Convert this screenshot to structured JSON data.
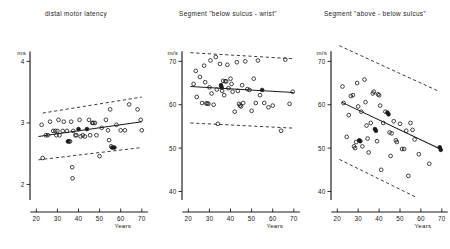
{
  "figure": {
    "panel_count": 3,
    "marker_open": "open-circle",
    "marker_filled": "filled-circle"
  },
  "chart_data": [
    {
      "type": "scatter",
      "title": "distal  motor  latency",
      "xlabel": "Years",
      "ylabel": "ms",
      "xlim": [
        17,
        72
      ],
      "ylim": [
        1.78,
        4.25
      ],
      "xticks": [
        20,
        30,
        40,
        50,
        60,
        70
      ],
      "yticks": [
        2,
        3,
        4
      ],
      "grid": false,
      "legend": "none",
      "regression": {
        "x": [
          21,
          70
        ],
        "y": [
          2.78,
          3.02
        ]
      },
      "confidence_upper": {
        "x": [
          23,
          70
        ],
        "y": [
          3.16,
          3.42
        ]
      },
      "confidence_lower": {
        "x": [
          21,
          70
        ],
        "y": [
          2.4,
          2.6
        ]
      },
      "points": [
        {
          "x": 22.5,
          "y": 2.97,
          "filled": false
        },
        {
          "x": 23.0,
          "y": 2.43,
          "filled": false
        },
        {
          "x": 24.5,
          "y": 2.8,
          "filled": false
        },
        {
          "x": 25.5,
          "y": 2.8,
          "filled": false
        },
        {
          "x": 26.5,
          "y": 3.02,
          "filled": false
        },
        {
          "x": 28.0,
          "y": 2.87,
          "filled": false
        },
        {
          "x": 29.0,
          "y": 2.87,
          "filled": false
        },
        {
          "x": 29.5,
          "y": 2.8,
          "filled": false
        },
        {
          "x": 30.0,
          "y": 2.87,
          "filled": false
        },
        {
          "x": 30.5,
          "y": 3.05,
          "filled": false
        },
        {
          "x": 31.0,
          "y": 2.8,
          "filled": false
        },
        {
          "x": 32.5,
          "y": 2.87,
          "filled": false
        },
        {
          "x": 33.0,
          "y": 3.02,
          "filled": false
        },
        {
          "x": 34.5,
          "y": 2.87,
          "filled": false
        },
        {
          "x": 35.0,
          "y": 2.7,
          "filled": true
        },
        {
          "x": 35.5,
          "y": 2.7,
          "filled": false
        },
        {
          "x": 36.0,
          "y": 2.7,
          "filled": false
        },
        {
          "x": 36.5,
          "y": 3.02,
          "filled": false
        },
        {
          "x": 37.0,
          "y": 2.28,
          "filled": false
        },
        {
          "x": 37.2,
          "y": 2.1,
          "filled": false
        },
        {
          "x": 37.5,
          "y": 2.87,
          "filled": false
        },
        {
          "x": 38.5,
          "y": 2.8,
          "filled": false
        },
        {
          "x": 39.0,
          "y": 2.8,
          "filled": false
        },
        {
          "x": 40.0,
          "y": 2.9,
          "filled": true
        },
        {
          "x": 40.5,
          "y": 3.05,
          "filled": false
        },
        {
          "x": 41.0,
          "y": 2.78,
          "filled": false
        },
        {
          "x": 42.0,
          "y": 2.8,
          "filled": false
        },
        {
          "x": 43.0,
          "y": 2.78,
          "filled": false
        },
        {
          "x": 44.0,
          "y": 2.9,
          "filled": true
        },
        {
          "x": 45.0,
          "y": 3.05,
          "filled": false
        },
        {
          "x": 45.5,
          "y": 2.8,
          "filled": false
        },
        {
          "x": 46.5,
          "y": 3.0,
          "filled": false
        },
        {
          "x": 47.0,
          "y": 3.0,
          "filled": false
        },
        {
          "x": 47.8,
          "y": 3.0,
          "filled": false
        },
        {
          "x": 48.5,
          "y": 2.8,
          "filled": false
        },
        {
          "x": 50.0,
          "y": 2.46,
          "filled": false
        },
        {
          "x": 51.0,
          "y": 2.92,
          "filled": false
        },
        {
          "x": 53.0,
          "y": 3.05,
          "filled": false
        },
        {
          "x": 54.0,
          "y": 2.88,
          "filled": false
        },
        {
          "x": 54.5,
          "y": 2.72,
          "filled": false
        },
        {
          "x": 55.0,
          "y": 3.22,
          "filled": false
        },
        {
          "x": 55.5,
          "y": 2.62,
          "filled": false
        },
        {
          "x": 56.0,
          "y": 2.6,
          "filled": true
        },
        {
          "x": 57.0,
          "y": 2.6,
          "filled": true
        },
        {
          "x": 58.0,
          "y": 2.97,
          "filled": false
        },
        {
          "x": 60.0,
          "y": 2.88,
          "filled": false
        },
        {
          "x": 62.0,
          "y": 2.88,
          "filled": false
        },
        {
          "x": 64.0,
          "y": 3.3,
          "filled": false
        },
        {
          "x": 68.0,
          "y": 3.22,
          "filled": false
        },
        {
          "x": 69.5,
          "y": 3.05,
          "filled": false
        },
        {
          "x": 70.0,
          "y": 2.88,
          "filled": false
        }
      ]
    },
    {
      "type": "scatter",
      "title": "Segment \"below sulcus - wrist\"",
      "xlabel": "Years",
      "ylabel": "m/s",
      "xlim": [
        17,
        72
      ],
      "ylim": [
        38.5,
        74
      ],
      "xticks": [
        20,
        30,
        40,
        50,
        60,
        70
      ],
      "yticks": [
        40,
        50,
        60,
        70
      ],
      "grid": false,
      "legend": "none",
      "regression": {
        "x": [
          21,
          70
        ],
        "y": [
          64.2,
          62.8
        ]
      },
      "confidence_upper": {
        "x": [
          21,
          70
        ],
        "y": [
          72.0,
          70.6
        ]
      },
      "confidence_lower": {
        "x": [
          21,
          70
        ],
        "y": [
          55.8,
          54.6
        ]
      },
      "points": [
        {
          "x": 22.5,
          "y": 64.8,
          "filled": false
        },
        {
          "x": 23.5,
          "y": 67.8,
          "filled": false
        },
        {
          "x": 24.0,
          "y": 61.8,
          "filled": false
        },
        {
          "x": 25.5,
          "y": 66.4,
          "filled": false
        },
        {
          "x": 26.5,
          "y": 60.4,
          "filled": false
        },
        {
          "x": 27.5,
          "y": 69.0,
          "filled": false
        },
        {
          "x": 28.0,
          "y": 65.2,
          "filled": false
        },
        {
          "x": 28.5,
          "y": 60.3,
          "filled": false
        },
        {
          "x": 29.0,
          "y": 60.3,
          "filled": false
        },
        {
          "x": 29.5,
          "y": 60.2,
          "filled": false
        },
        {
          "x": 30.0,
          "y": 64.0,
          "filled": false
        },
        {
          "x": 30.5,
          "y": 70.2,
          "filled": false
        },
        {
          "x": 31.0,
          "y": 62.6,
          "filled": false
        },
        {
          "x": 32.0,
          "y": 60.0,
          "filled": false
        },
        {
          "x": 33.0,
          "y": 71.0,
          "filled": false
        },
        {
          "x": 33.5,
          "y": 63.5,
          "filled": false
        },
        {
          "x": 34.0,
          "y": 55.6,
          "filled": false
        },
        {
          "x": 35.0,
          "y": 69.4,
          "filled": false
        },
        {
          "x": 35.5,
          "y": 64.5,
          "filled": true
        },
        {
          "x": 35.8,
          "y": 64.0,
          "filled": true
        },
        {
          "x": 36.0,
          "y": 63.2,
          "filled": false
        },
        {
          "x": 36.5,
          "y": 65.5,
          "filled": false
        },
        {
          "x": 37.0,
          "y": 62.2,
          "filled": false
        },
        {
          "x": 37.5,
          "y": 65.4,
          "filled": false
        },
        {
          "x": 38.0,
          "y": 65.4,
          "filled": false
        },
        {
          "x": 38.5,
          "y": 69.2,
          "filled": false
        },
        {
          "x": 39.0,
          "y": 63.8,
          "filled": false
        },
        {
          "x": 40.0,
          "y": 66.0,
          "filled": false
        },
        {
          "x": 40.5,
          "y": 64.8,
          "filled": false
        },
        {
          "x": 41.0,
          "y": 63.0,
          "filled": false
        },
        {
          "x": 42.0,
          "y": 58.4,
          "filled": false
        },
        {
          "x": 43.0,
          "y": 69.8,
          "filled": false
        },
        {
          "x": 43.5,
          "y": 63.2,
          "filled": false
        },
        {
          "x": 44.0,
          "y": 60.2,
          "filled": false
        },
        {
          "x": 44.5,
          "y": 59.8,
          "filled": false
        },
        {
          "x": 45.0,
          "y": 59.6,
          "filled": false
        },
        {
          "x": 45.5,
          "y": 64.5,
          "filled": false
        },
        {
          "x": 46.0,
          "y": 60.4,
          "filled": false
        },
        {
          "x": 47.0,
          "y": 70.0,
          "filled": false
        },
        {
          "x": 48.0,
          "y": 63.6,
          "filled": false
        },
        {
          "x": 49.0,
          "y": 63.4,
          "filled": false
        },
        {
          "x": 50.0,
          "y": 58.6,
          "filled": false
        },
        {
          "x": 51.0,
          "y": 66.0,
          "filled": false
        },
        {
          "x": 52.0,
          "y": 60.4,
          "filled": false
        },
        {
          "x": 53.0,
          "y": 70.2,
          "filled": false
        },
        {
          "x": 54.0,
          "y": 62.2,
          "filled": false
        },
        {
          "x": 55.0,
          "y": 63.4,
          "filled": true
        },
        {
          "x": 56.0,
          "y": 60.4,
          "filled": false
        },
        {
          "x": 58.0,
          "y": 59.4,
          "filled": false
        },
        {
          "x": 60.0,
          "y": 59.8,
          "filled": false
        },
        {
          "x": 64.0,
          "y": 54.0,
          "filled": false
        },
        {
          "x": 66.0,
          "y": 70.4,
          "filled": false
        },
        {
          "x": 68.0,
          "y": 60.2,
          "filled": false
        },
        {
          "x": 69.5,
          "y": 63.0,
          "filled": false
        }
      ]
    },
    {
      "type": "scatter",
      "title": "Segment \"above - below sulcus\"",
      "xlabel": "Years",
      "ylabel": "m/s",
      "xlim": [
        17,
        72
      ],
      "ylim": [
        38.5,
        74
      ],
      "xticks": [
        20,
        30,
        40,
        50,
        60,
        70
      ],
      "yticks": [
        40,
        50,
        60,
        70
      ],
      "grid": false,
      "legend": "none",
      "regression": {
        "x": [
          22,
          70
        ],
        "y": [
          60.6,
          49.6
        ]
      },
      "confidence_upper": {
        "x": [
          21,
          69
        ],
        "y": [
          73.6,
          63.0
        ]
      },
      "confidence_lower": {
        "x": [
          21,
          58
        ],
        "y": [
          47.4,
          38.6
        ]
      },
      "points": [
        {
          "x": 22.5,
          "y": 64.2,
          "filled": false
        },
        {
          "x": 23.0,
          "y": 60.4,
          "filled": false
        },
        {
          "x": 24.5,
          "y": 52.6,
          "filled": false
        },
        {
          "x": 25.5,
          "y": 57.6,
          "filled": false
        },
        {
          "x": 26.5,
          "y": 62.0,
          "filled": false
        },
        {
          "x": 27.5,
          "y": 62.2,
          "filled": false
        },
        {
          "x": 28.0,
          "y": 50.4,
          "filled": false
        },
        {
          "x": 28.5,
          "y": 50.0,
          "filled": false
        },
        {
          "x": 29.0,
          "y": 51.4,
          "filled": false
        },
        {
          "x": 29.5,
          "y": 65.0,
          "filled": false
        },
        {
          "x": 30.0,
          "y": 59.6,
          "filled": false
        },
        {
          "x": 30.5,
          "y": 51.8,
          "filled": true
        },
        {
          "x": 31.0,
          "y": 51.6,
          "filled": true
        },
        {
          "x": 31.5,
          "y": 58.4,
          "filled": false
        },
        {
          "x": 32.0,
          "y": 50.4,
          "filled": false
        },
        {
          "x": 33.0,
          "y": 65.8,
          "filled": false
        },
        {
          "x": 33.5,
          "y": 60.6,
          "filled": false
        },
        {
          "x": 34.0,
          "y": 55.2,
          "filled": false
        },
        {
          "x": 34.5,
          "y": 52.2,
          "filled": false
        },
        {
          "x": 35.0,
          "y": 49.0,
          "filled": false
        },
        {
          "x": 36.0,
          "y": 55.8,
          "filled": false
        },
        {
          "x": 37.0,
          "y": 62.6,
          "filled": false
        },
        {
          "x": 37.5,
          "y": 63.0,
          "filled": false
        },
        {
          "x": 38.0,
          "y": 54.4,
          "filled": true
        },
        {
          "x": 38.5,
          "y": 54.0,
          "filled": true
        },
        {
          "x": 39.0,
          "y": 51.6,
          "filled": false
        },
        {
          "x": 39.5,
          "y": 62.4,
          "filled": false
        },
        {
          "x": 40.0,
          "y": 62.2,
          "filled": false
        },
        {
          "x": 40.5,
          "y": 59.8,
          "filled": false
        },
        {
          "x": 41.0,
          "y": 45.0,
          "filled": false
        },
        {
          "x": 42.0,
          "y": 55.8,
          "filled": false
        },
        {
          "x": 43.0,
          "y": 58.4,
          "filled": false
        },
        {
          "x": 44.0,
          "y": 58.2,
          "filled": true
        },
        {
          "x": 44.5,
          "y": 57.8,
          "filled": true
        },
        {
          "x": 45.0,
          "y": 53.6,
          "filled": false
        },
        {
          "x": 45.5,
          "y": 48.2,
          "filled": false
        },
        {
          "x": 46.0,
          "y": 53.4,
          "filled": false
        },
        {
          "x": 47.0,
          "y": 56.2,
          "filled": false
        },
        {
          "x": 48.0,
          "y": 51.8,
          "filled": false
        },
        {
          "x": 48.5,
          "y": 51.4,
          "filled": false
        },
        {
          "x": 50.0,
          "y": 55.6,
          "filled": false
        },
        {
          "x": 51.0,
          "y": 49.8,
          "filled": false
        },
        {
          "x": 52.0,
          "y": 49.8,
          "filled": false
        },
        {
          "x": 53.0,
          "y": 54.0,
          "filled": false
        },
        {
          "x": 54.0,
          "y": 43.6,
          "filled": false
        },
        {
          "x": 55.0,
          "y": 55.8,
          "filled": false
        },
        {
          "x": 56.0,
          "y": 54.2,
          "filled": false
        },
        {
          "x": 57.0,
          "y": 52.0,
          "filled": false
        },
        {
          "x": 59.0,
          "y": 48.6,
          "filled": false
        },
        {
          "x": 64.0,
          "y": 46.4,
          "filled": false
        },
        {
          "x": 69.0,
          "y": 50.2,
          "filled": true
        },
        {
          "x": 69.5,
          "y": 49.6,
          "filled": true
        }
      ]
    }
  ]
}
